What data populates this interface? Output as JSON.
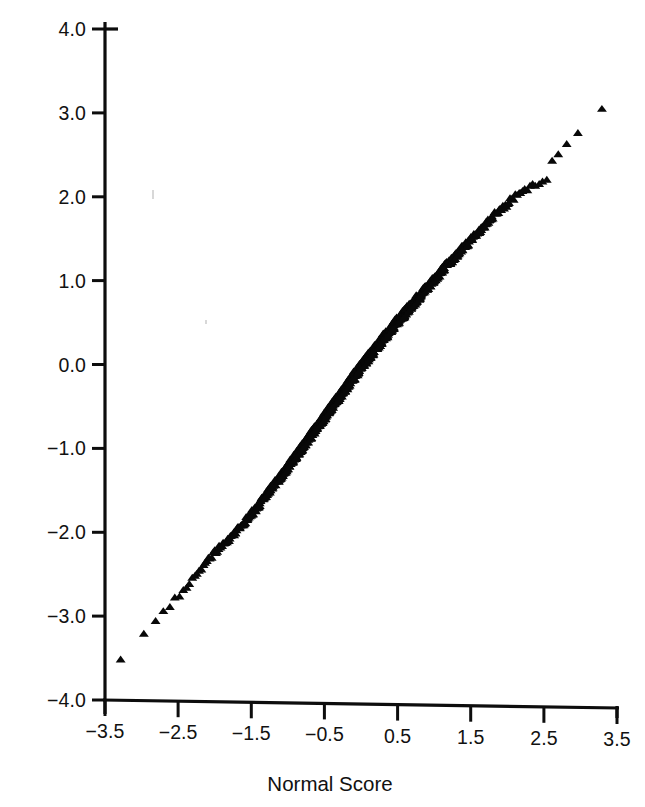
{
  "figure": {
    "kind": "normal-probability-plot",
    "background_color": "#ffffff",
    "ink_color": "#0d0d0d",
    "width": 645,
    "height": 807
  },
  "axes": {
    "x_title": "Normal Score",
    "y_title": "",
    "x_tick_labels": [
      "-3.5",
      "-2.5",
      "-1.5",
      "-0.5",
      "0.5",
      "1.5",
      "2.5",
      "3.5"
    ],
    "y_tick_labels": [
      "4.0",
      "3.0",
      "2.0",
      "1.0",
      "0.0",
      "-1.0",
      "-2.0",
      "-3.0",
      "-4.0"
    ]
  },
  "chart_data": {
    "type": "scatter",
    "title": "",
    "subtitle": "",
    "xlabel": "Normal Score",
    "ylabel": "",
    "xlim": [
      -3.5,
      3.5
    ],
    "ylim": [
      -4.0,
      4.0
    ],
    "xticks": [
      -3.5,
      -2.5,
      -1.5,
      -0.5,
      0.5,
      1.5,
      2.5,
      3.5
    ],
    "yticks": [
      4.0,
      3.0,
      2.0,
      1.0,
      0.0,
      -1.0,
      -2.0,
      -3.0,
      -4.0
    ],
    "xtick_labels": [
      "-3.5",
      "-2.5",
      "-1.5",
      "-0.5",
      "0.5",
      "1.5",
      "2.5",
      "3.5"
    ],
    "ytick_labels": [
      "4.0",
      "3.0",
      "2.0",
      "1.0",
      "0.0",
      "-1.0",
      "-2.0",
      "-3.0",
      "-4.0"
    ],
    "grid": false,
    "legend": null,
    "legend_position": "none",
    "marker": "triangle-up",
    "marker_color": "#080808",
    "marker_size_px": 7,
    "annotations": [],
    "series": [
      {
        "name": "sample quantiles",
        "n_points_approx": 1000,
        "control_points": [
          [
            -3.32,
            -3.52
          ],
          [
            -3.18,
            -3.4
          ],
          [
            -3.05,
            -3.3
          ],
          [
            -2.95,
            -3.2
          ],
          [
            -2.86,
            -3.12
          ],
          [
            -2.78,
            -3.04
          ],
          [
            -2.7,
            -2.96
          ],
          [
            -2.6,
            -2.86
          ],
          [
            -2.5,
            -2.76
          ],
          [
            -2.4,
            -2.66
          ],
          [
            -2.3,
            -2.56
          ],
          [
            -2.2,
            -2.46
          ],
          [
            -2.1,
            -2.34
          ],
          [
            -2.0,
            -2.24
          ],
          [
            -1.9,
            -2.16
          ],
          [
            -1.8,
            -2.08
          ],
          [
            -1.7,
            -1.98
          ],
          [
            -1.6,
            -1.88
          ],
          [
            -1.5,
            -1.78
          ],
          [
            -1.4,
            -1.68
          ],
          [
            -1.3,
            -1.56
          ],
          [
            -1.2,
            -1.44
          ],
          [
            -1.1,
            -1.33
          ],
          [
            -1.0,
            -1.22
          ],
          [
            -0.9,
            -1.1
          ],
          [
            -0.8,
            -0.98
          ],
          [
            -0.7,
            -0.86
          ],
          [
            -0.6,
            -0.74
          ],
          [
            -0.5,
            -0.62
          ],
          [
            -0.4,
            -0.5
          ],
          [
            -0.3,
            -0.38
          ],
          [
            -0.2,
            -0.26
          ],
          [
            -0.1,
            -0.14
          ],
          [
            0.0,
            -0.02
          ],
          [
            0.1,
            0.09
          ],
          [
            0.2,
            0.2
          ],
          [
            0.3,
            0.31
          ],
          [
            0.4,
            0.42
          ],
          [
            0.5,
            0.52
          ],
          [
            0.6,
            0.62
          ],
          [
            0.7,
            0.72
          ],
          [
            0.8,
            0.82
          ],
          [
            0.9,
            0.92
          ],
          [
            1.0,
            1.02
          ],
          [
            1.1,
            1.12
          ],
          [
            1.2,
            1.21
          ],
          [
            1.3,
            1.31
          ],
          [
            1.4,
            1.4
          ],
          [
            1.5,
            1.49
          ],
          [
            1.6,
            1.58
          ],
          [
            1.7,
            1.67
          ],
          [
            1.8,
            1.76
          ],
          [
            1.9,
            1.84
          ],
          [
            2.0,
            1.92
          ],
          [
            2.1,
            2.0
          ],
          [
            2.2,
            2.06
          ],
          [
            2.3,
            2.12
          ],
          [
            2.4,
            2.16
          ],
          [
            2.5,
            2.19
          ],
          [
            2.58,
            2.21
          ],
          [
            2.62,
            2.45
          ],
          [
            2.7,
            2.52
          ],
          [
            2.8,
            2.6
          ],
          [
            2.9,
            2.7
          ],
          [
            3.0,
            2.8
          ],
          [
            3.08,
            2.96
          ],
          [
            3.16,
            2.99
          ],
          [
            3.24,
            3.0
          ],
          [
            3.33,
            3.05
          ]
        ]
      }
    ]
  }
}
